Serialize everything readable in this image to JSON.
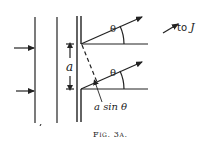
{
  "figure": {
    "caption": "Fig. 3a.",
    "labels": {
      "slit_spacing": "a",
      "angle_upper": "θ",
      "angle_lower": "θ",
      "path_difference_a": "a",
      "path_difference_rest": " sin θ",
      "direction_prefix": "to ",
      "direction_target": "J"
    },
    "colors": {
      "ink": "#222222",
      "background": "#ffffff"
    }
  }
}
